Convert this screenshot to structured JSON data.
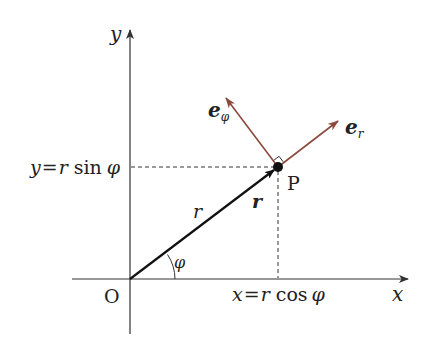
{
  "diagram": {
    "colors": {
      "axis": "#333333",
      "vector": "#111111",
      "unit_vectors": "#8b4a3c",
      "dashed": "#333333"
    },
    "labels": {
      "x_axis": "x",
      "y_axis": "y",
      "origin": "O",
      "point": "P",
      "r_magnitude": "r",
      "r_vector": "r",
      "angle": "φ",
      "y_eq": "y",
      "y_rhs_r": "r",
      "y_rhs_fn": "sin",
      "y_rhs_phi": "φ",
      "x_eq": "x",
      "x_rhs_r": "r",
      "x_rhs_fn": "cos",
      "x_rhs_phi": "φ",
      "equals": "=",
      "e": "e",
      "e_r_sub": "r",
      "e_phi_sub": "φ"
    }
  }
}
